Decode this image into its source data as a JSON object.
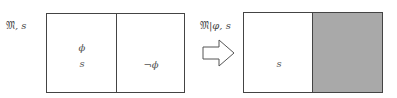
{
  "left_model": {
    "label_model": "𝔐",
    "label_sep": ", ",
    "label_state": "s",
    "left_region": {
      "formula": "ϕ",
      "state": "s"
    },
    "right_region": {
      "formula": "¬ϕ"
    }
  },
  "arrow": {
    "icon": "hollow-right-arrow-icon"
  },
  "right_model": {
    "label_model": "𝔐",
    "label_rest": "|φ, s",
    "left_region": {
      "state": "s"
    },
    "right_region": {
      "fill": "#a9a9a9",
      "status": "removed"
    }
  },
  "colors": {
    "stroke": "#444444",
    "shade": "#a9a9a9",
    "background": "#ffffff"
  }
}
